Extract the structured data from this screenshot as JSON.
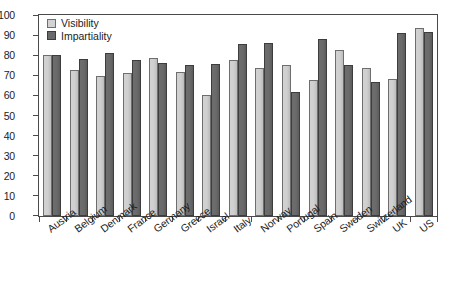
{
  "chart_data": {
    "type": "bar",
    "title": "",
    "xlabel": "",
    "ylabel": "",
    "ylim": [
      0,
      100
    ],
    "yticks": [
      0,
      10,
      20,
      30,
      40,
      50,
      60,
      70,
      80,
      90,
      100
    ],
    "ytick_labels": [
      "0",
      "10",
      "20",
      "30",
      "40",
      "50",
      "60",
      "70",
      "80",
      "90",
      "100"
    ],
    "grid": false,
    "legend_position": "top-left",
    "categories": [
      "Austria",
      "Belgium",
      "Denmark",
      "France",
      "Germany",
      "Greece",
      "Israel",
      "Italy",
      "Norway",
      "Portugal",
      "Spain",
      "Sweden",
      "Switzerland",
      "UK",
      "US"
    ],
    "series": [
      {
        "name": "Visibility",
        "color": "#d2d2d2",
        "values": [
          80,
          72.5,
          69.5,
          71,
          78.5,
          71.5,
          60,
          77.5,
          73.5,
          75,
          67.5,
          82.5,
          73.5,
          68,
          93.5
        ]
      },
      {
        "name": "Impartiality",
        "color": "#6a6a6a",
        "values": [
          80,
          78,
          81,
          77.5,
          76,
          75,
          75.5,
          85.5,
          86,
          61.5,
          88,
          75,
          66.5,
          91,
          91.5
        ]
      }
    ]
  },
  "legend": {
    "items": [
      {
        "label": "Visibility",
        "key": "visibility"
      },
      {
        "label": "Impartiality",
        "key": "impartiality"
      }
    ]
  },
  "colors": {
    "visibility_fill": "#d2d2d2",
    "visibility_stroke": "#6e6e6e",
    "impartiality_fill": "#6a6a6a",
    "impartiality_stroke": "#3d3d3d",
    "axis": "#4a4a4a",
    "text": "#1c1c1c",
    "background": "#ffffff"
  }
}
